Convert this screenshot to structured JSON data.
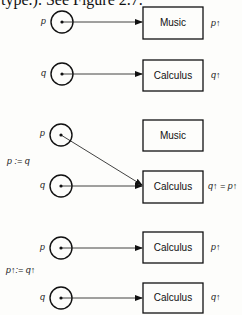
{
  "header_text": "type.). See Figure 2.7.",
  "panels": [
    {
      "name": "initial",
      "step_label": "",
      "pointers": [
        {
          "var": "p",
          "cx": 62,
          "cy": 22,
          "target_box": 0
        },
        {
          "var": "q",
          "cx": 62,
          "cy": 74,
          "target_box": 1
        }
      ],
      "boxes": [
        {
          "x": 143,
          "y": 7,
          "w": 60,
          "h": 32,
          "text": "Music",
          "deref_label": "p↑"
        },
        {
          "x": 143,
          "y": 60,
          "w": 60,
          "h": 31,
          "text": "Calculus",
          "deref_label": "q↑"
        }
      ]
    },
    {
      "name": "after-pointer-assignment",
      "step_label": "p := q",
      "pointers": [
        {
          "var": "p",
          "cx": 61,
          "cy": 135,
          "target_box": 1
        },
        {
          "var": "q",
          "cx": 61,
          "cy": 186,
          "target_box": 1
        }
      ],
      "boxes": [
        {
          "x": 143,
          "y": 120,
          "w": 60,
          "h": 31,
          "text": "Music",
          "deref_label": ""
        },
        {
          "x": 143,
          "y": 171,
          "w": 60,
          "h": 32,
          "text": "Calculus",
          "deref_label": "q↑ = p↑"
        }
      ]
    },
    {
      "name": "after-value-assignment",
      "step_label": "p↑:= q↑",
      "pointers": [
        {
          "var": "p",
          "cx": 61,
          "cy": 248,
          "target_box": 0
        },
        {
          "var": "q",
          "cx": 61,
          "cy": 298,
          "target_box": 1
        }
      ],
      "boxes": [
        {
          "x": 143,
          "y": 232,
          "w": 60,
          "h": 31,
          "text": "Calculus",
          "deref_label": "p↑"
        },
        {
          "x": 143,
          "y": 283,
          "w": 60,
          "h": 30,
          "text": "Calculus",
          "deref_label": "q↑"
        }
      ]
    }
  ],
  "style": {
    "stroke": "#111111",
    "circle_radius": 11
  }
}
